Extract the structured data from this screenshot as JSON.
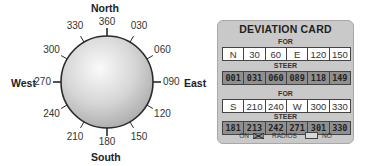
{
  "compass": {
    "cardinals": {
      "north": "North",
      "south": "South",
      "east": "East",
      "west": "West"
    },
    "headings": [
      {
        "label": "360",
        "angle": 0
      },
      {
        "label": "030",
        "angle": 30
      },
      {
        "label": "060",
        "angle": 60
      },
      {
        "label": "090",
        "angle": 90
      },
      {
        "label": "120",
        "angle": 120
      },
      {
        "label": "150",
        "angle": 150
      },
      {
        "label": "180",
        "angle": 180
      },
      {
        "label": "210",
        "angle": 210
      },
      {
        "label": "240",
        "angle": 240
      },
      {
        "label": "270",
        "angle": 270
      },
      {
        "label": "300",
        "angle": 300
      },
      {
        "label": "330",
        "angle": 330
      }
    ]
  },
  "deviation_card": {
    "title": "DEVIATION CARD",
    "for_label": "FOR",
    "steer_label": "STEER",
    "table1": {
      "for": [
        "N",
        "30",
        "60",
        "E",
        "120",
        "150"
      ],
      "steer": [
        "001",
        "031",
        "060",
        "089",
        "118",
        "149"
      ]
    },
    "table2": {
      "for": [
        "S",
        "210",
        "240",
        "W",
        "300",
        "330"
      ],
      "steer": [
        "181",
        "213",
        "242",
        "271",
        "301",
        "330"
      ]
    },
    "legend": {
      "on_label": "ON",
      "radios_label": "RADIOS",
      "no_label": "NO"
    }
  },
  "colors": {
    "card_bg": "#c9c9c9",
    "steer_bg": "#8f8f8f",
    "for_bg": "#ffffff"
  }
}
